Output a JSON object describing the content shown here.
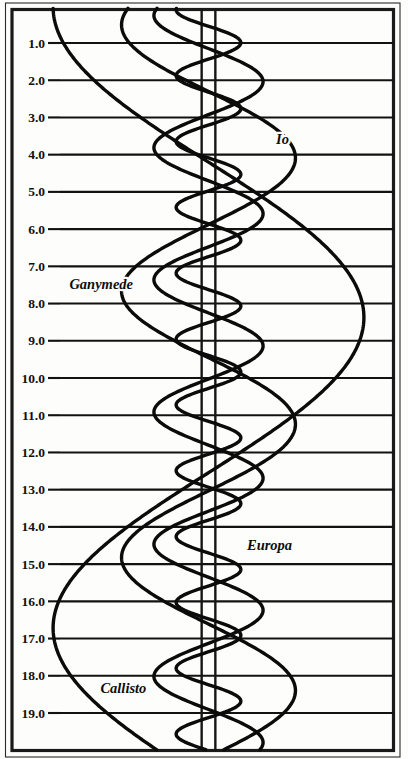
{
  "figure": {
    "background_color": "#fdfdfb",
    "line_color": "#0b0b0b",
    "frame_color": "#1a1a1a"
  },
  "axis": {
    "ylabel": "",
    "ytick_labels": [
      "1.0",
      "2.0",
      "3.0",
      "4.0",
      "5.0",
      "6.0",
      "7.0",
      "8.0",
      "9.0",
      "10.0",
      "11.0",
      "12.0",
      "13.0",
      "14.0",
      "15.0",
      "16.0",
      "17.0",
      "18.0",
      "19.0"
    ],
    "ytick_values": [
      1,
      2,
      3,
      4,
      5,
      6,
      7,
      8,
      9,
      10,
      11,
      12,
      13,
      14,
      15,
      16,
      17,
      18,
      19
    ],
    "ylim": [
      0.07,
      20.0
    ],
    "xlim": [
      -1.0,
      1.0
    ],
    "grid": true,
    "direction": "time increases downward"
  },
  "jupiter_disk": {
    "label": "jupiter-disk-lines",
    "left_x": -0.037,
    "right_x": 0.037
  },
  "moon_labels": [
    {
      "name": "Io",
      "text": "Io",
      "x": 0.4,
      "y": 3.72
    },
    {
      "name": "Ganymede",
      "text": "Ganymede",
      "x": -0.58,
      "y": 7.62
    },
    {
      "name": "Europa",
      "text": "Europa",
      "x": 0.33,
      "y": 14.62
    },
    {
      "name": "Callisto",
      "text": "Callisto",
      "x": -0.46,
      "y": 18.45
    }
  ],
  "chart_data": {
    "type": "line",
    "xlabel": "",
    "ylabel": "",
    "xlim": [
      -1.0,
      1.0
    ],
    "ylim": [
      0.07,
      20.0
    ],
    "grid": true,
    "legend": "inline labels on curves",
    "x_is_elongation": true,
    "y_is_days": true,
    "series": [
      {
        "name": "Io",
        "color": "#0b0b0b",
        "amplitude": 0.175,
        "period_days": 1.769,
        "phase_days": 0.55,
        "note": "innermost, fastest, smallest amplitude"
      },
      {
        "name": "Europa",
        "color": "#0b0b0b",
        "amplitude": 0.295,
        "period_days": 3.551,
        "phase_days": 1.15,
        "note": "second moon"
      },
      {
        "name": "Ganymede",
        "color": "#0b0b0b",
        "amplitude": 0.47,
        "period_days": 7.155,
        "phase_days": 2.3,
        "note": "third moon, large amplitude"
      },
      {
        "name": "Callisto",
        "color": "#0b0b0b",
        "amplitude": 0.84,
        "period_days": 16.69,
        "phase_days": 4.2,
        "note": "outermost, slowest, widest swing"
      }
    ]
  }
}
